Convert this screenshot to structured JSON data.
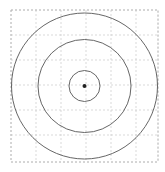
{
  "figure": {
    "type": "concentric-circles",
    "canvas": {
      "width": 165,
      "height": 172
    },
    "background_color": "#ffffff"
  },
  "chart_data": {
    "type": "scatter",
    "xlabel": "",
    "ylabel": "",
    "grid": true,
    "legend": null,
    "center": {
      "x": 84.5,
      "y": 86
    },
    "circles": [
      {
        "name": "outer-circle",
        "radius": 73,
        "stroke": "#555555",
        "stroke_width": 0.9,
        "fill": "none"
      },
      {
        "name": "middle-circle",
        "radius": 46.5,
        "stroke": "#555555",
        "stroke_width": 0.9,
        "fill": "none"
      },
      {
        "name": "inner-circle",
        "radius": 15.5,
        "stroke": "#555555",
        "stroke_width": 0.9,
        "fill": "none"
      }
    ],
    "center_point": {
      "name": "center-dot",
      "x": 84.5,
      "y": 86,
      "radius": 2,
      "fill": "#222222"
    },
    "plot_area": {
      "x": 11,
      "y": 10,
      "width": 147,
      "height": 152
    },
    "gridlines": {
      "spacing": 25,
      "color": "#c9c9c9",
      "dash": "2,2",
      "stroke_width": 0.7,
      "x_positions": [
        11,
        36,
        61,
        86,
        111,
        136,
        158
      ],
      "y_positions": [
        10,
        35,
        60,
        85,
        110,
        135,
        162
      ]
    },
    "border": {
      "color": "#b5b5b5",
      "dash": "2,2",
      "stroke_width": 0.8
    }
  }
}
